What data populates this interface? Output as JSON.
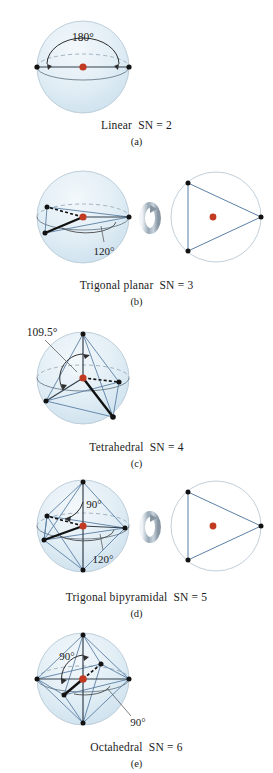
{
  "figure": {
    "colors": {
      "sphere_fill_top": "#e8f1f7",
      "sphere_fill_bottom": "#cfe3ef",
      "sphere_outline": "#b9c9d6",
      "bond_blue": "#5b7fa6",
      "bond_dark": "#1a1a1a",
      "center_atom_red": "#c23a22",
      "vertex_black": "#121212",
      "angle_arc": "#3a3a3a",
      "dashed_gray": "#7d8b96",
      "text": "#1b1b1b"
    }
  },
  "panels": [
    {
      "letter": "(a)",
      "name": "Linear",
      "sn_label": "SN = 2",
      "angle_labels": [
        "180°"
      ],
      "vertices": 2,
      "has_rotation_icon": false,
      "has_side_circle": false
    },
    {
      "letter": "(b)",
      "name": "Trigonal planar",
      "sn_label": "SN = 3",
      "angle_labels": [
        "120°"
      ],
      "vertices": 3,
      "has_rotation_icon": true,
      "has_side_circle": true,
      "rotation_icon": "rotate-arrow-icon"
    },
    {
      "letter": "(c)",
      "name": "Tetrahedral",
      "sn_label": "SN = 4",
      "angle_labels": [
        "109.5°"
      ],
      "vertices": 4,
      "has_rotation_icon": false,
      "has_side_circle": false
    },
    {
      "letter": "(d)",
      "name": "Trigonal bipyramidal",
      "sn_label": "SN = 5",
      "angle_labels": [
        "90°",
        "120°"
      ],
      "vertices": 5,
      "has_rotation_icon": true,
      "has_side_circle": true,
      "rotation_icon": "rotate-arrow-icon"
    },
    {
      "letter": "(e)",
      "name": "Octahedral",
      "sn_label": "SN = 6",
      "angle_labels": [
        "90°",
        "90°"
      ],
      "vertices": 6,
      "has_rotation_icon": false,
      "has_side_circle": false
    }
  ]
}
